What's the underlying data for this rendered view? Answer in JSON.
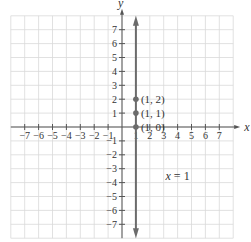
{
  "chart_data": {
    "type": "line",
    "title": "",
    "xlabel": "x",
    "ylabel": "y",
    "xlim": [
      -8,
      8
    ],
    "ylim": [
      -8,
      8
    ],
    "grid": true,
    "x_ticks": [
      -7,
      -6,
      -5,
      -4,
      -3,
      -2,
      -1,
      1,
      2,
      3,
      4,
      5,
      6,
      7
    ],
    "y_ticks": [
      -7,
      -6,
      -5,
      -4,
      -3,
      -2,
      -1,
      1,
      2,
      3,
      4,
      5,
      6,
      7
    ],
    "series": [
      {
        "name": "x = 1",
        "kind": "vertical-line",
        "x": 1,
        "arrows": "both"
      }
    ],
    "points": [
      {
        "x": 1,
        "y": 2,
        "label": "(1, 2)"
      },
      {
        "x": 1,
        "y": 1,
        "label": "(1, 1)"
      },
      {
        "x": 1,
        "y": 0,
        "label": "(1, 0)"
      }
    ],
    "annotations": [
      {
        "text": "x = 1",
        "x": 4,
        "y": -3.5
      }
    ]
  },
  "colors": {
    "grid": "#d9d9d9",
    "axis": "#555555",
    "line": "#6b6b6b",
    "point": "#6b6b6b",
    "text": "#333333"
  }
}
